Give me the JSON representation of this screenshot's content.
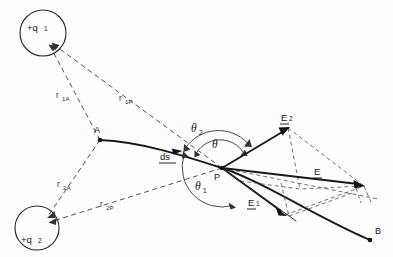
{
  "figure": {
    "background_color": "#fdfdfd",
    "ink_color": "#161616"
  },
  "charges": [
    {
      "id": "q1",
      "label": "+q",
      "subscript": "1",
      "cx": 43,
      "cy": 33,
      "r": 23
    },
    {
      "id": "q2",
      "label": "+q",
      "subscript": "2",
      "cx": 37,
      "cy": 228,
      "r": 22
    }
  ],
  "points": [
    {
      "id": "A",
      "label": "A",
      "x": 100,
      "y": 140,
      "label_x": 94,
      "label_y": 130
    },
    {
      "id": "P",
      "label": "P",
      "x": 222,
      "y": 168,
      "label_x": 213,
      "label_y": 177
    },
    {
      "id": "B",
      "label": "B",
      "x": 370,
      "y": 240,
      "label_x": 375,
      "label_y": 233
    }
  ],
  "distance_labels": [
    {
      "id": "r1A",
      "base": "r",
      "sub": "1A",
      "x": 60,
      "y": 95
    },
    {
      "id": "r1P",
      "base": "r",
      "sub": "1P",
      "x": 122,
      "y": 98
    },
    {
      "id": "r2A",
      "base": "r",
      "sub": "2A",
      "x": 61,
      "y": 184
    },
    {
      "id": "r2P",
      "base": "r",
      "sub": "2P",
      "x": 104,
      "y": 204
    }
  ],
  "angle_labels": [
    {
      "id": "theta2",
      "glyph": "θ",
      "sub": "2",
      "x": 196,
      "y": 128
    },
    {
      "id": "theta",
      "glyph": "θ",
      "sub": "",
      "x": 215,
      "y": 144
    },
    {
      "id": "theta1",
      "glyph": "θ",
      "sub": "1",
      "x": 200,
      "y": 186
    }
  ],
  "vector_labels": [
    {
      "id": "ds",
      "base": "ds",
      "sub": "",
      "x": 166,
      "y": 157,
      "underlined": true
    },
    {
      "id": "E2",
      "base": "E",
      "sub": "2",
      "x": 285,
      "y": 120,
      "underlined": true
    },
    {
      "id": "E",
      "base": "E",
      "sub": "",
      "x": 317,
      "y": 173,
      "underlined": true
    },
    {
      "id": "E1",
      "base": "E",
      "sub": "1",
      "x": 252,
      "y": 205,
      "underlined": true
    }
  ],
  "vectors": [
    {
      "id": "E1-vector",
      "name": "E1",
      "from": "P",
      "to_x": 285,
      "to_y": 215
    },
    {
      "id": "E2-vector",
      "name": "E2",
      "from": "P",
      "to_x": 288,
      "to_y": 128
    },
    {
      "id": "E-resultant",
      "name": "E",
      "from": "P",
      "to_x": 364,
      "to_y": 186
    }
  ],
  "notes": {
    "path_label": "curved path from A through P to B",
    "ds_description": "tangential path element at P",
    "construction": "dashed parallelogram showing vector addition of E1 and E2 giving resultant E"
  }
}
